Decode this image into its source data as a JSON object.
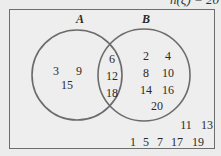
{
  "diagram": {
    "universal_label": "n(ξ) = 20",
    "sets": [
      {
        "name": "A",
        "label": "A"
      },
      {
        "name": "B",
        "label": "B"
      }
    ],
    "regions": {
      "only_A": [
        "3",
        "9",
        "15"
      ],
      "A_and_B": [
        "6",
        "12",
        "18"
      ],
      "only_B": [
        "2",
        "4",
        "8",
        "10",
        "14",
        "16",
        "20"
      ],
      "neither": [
        "11",
        "13",
        "1",
        "5",
        "7",
        "17",
        "19"
      ]
    },
    "colors": {
      "circle_stroke": "#6b6b6b",
      "frame_stroke": "#6d6d6d",
      "background": "#eeeeee",
      "text": "#2a2a2a"
    }
  }
}
